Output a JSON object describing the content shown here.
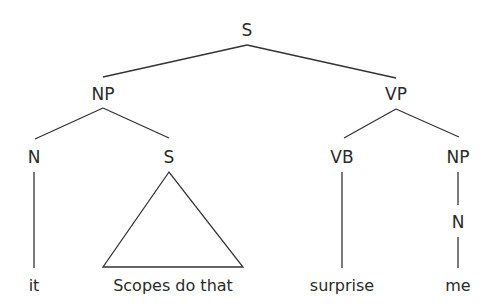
{
  "diagram": {
    "type": "syntax-tree",
    "colors": {
      "line": "#333333",
      "text": "#2a2a2a",
      "background": "#ffffff"
    },
    "nodes": {
      "root_s": "S",
      "np": "NP",
      "vp": "VP",
      "n_it": "N",
      "s_embedded": "S",
      "vb": "VB",
      "np_obj": "NP",
      "n_me": "N"
    },
    "leaves": {
      "it": "it",
      "scopes_do_that": "Scopes do that",
      "surprise": "surprise",
      "me": "me"
    },
    "structure": "[S [NP [N it] [S Scopes do that]] [VP [VB surprise] [NP [N me]]]]"
  }
}
